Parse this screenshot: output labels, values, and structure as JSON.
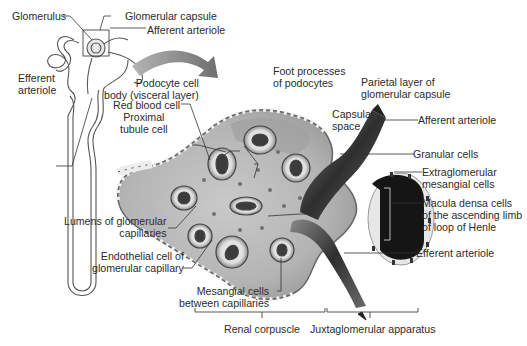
{
  "diagram": {
    "style": "grayscale anatomical illustration",
    "colors": {
      "background": "#ffffff",
      "text": "#2b2b2b",
      "leader_lines": "#333333",
      "tissue_light": "#d9d9d9",
      "tissue_mid": "#a8a8a8",
      "tissue_dark": "#3a3a3a",
      "arrow": "#8a8a8a"
    },
    "inset": {
      "name": "Nephron overview",
      "labels": {
        "glomerulus": "Glomerulus",
        "glomerular_capsule": "Glomerular capsule",
        "afferent_arteriole": "Afferent arteriole",
        "efferent_arteriole_1": "Efferent",
        "efferent_arteriole_2": "arteriole"
      }
    },
    "labels": {
      "podocyte_1": "Podocyte cell",
      "podocyte_2": "body (visceral layer)",
      "foot_processes_1": "Foot processes",
      "foot_processes_2": "of podocytes",
      "parietal_1": "Parietal layer of",
      "parietal_2": "glomerular capsule",
      "capsular_space_1": "Capsular",
      "capsular_space_2": "space",
      "afferent_arteriole": "Afferent arteriole",
      "red_blood_cell": "Red blood cell",
      "proximal_1": "Proximal",
      "proximal_2": "tubule cell",
      "granular_cells": "Granular cells",
      "extraglomerular_1": "Extraglomerular",
      "extraglomerular_2": "mesangial cells",
      "macula_densa_1": "Macula densa cells",
      "macula_densa_2": "of the ascending limb",
      "macula_densa_3": "of loop of Henle",
      "lumens_1": "Lumens of glomerular",
      "lumens_2": "capillaries",
      "endothelial_1": "Endothelial cell of",
      "endothelial_2": "glomerular capillary",
      "efferent_arteriole": "Efferent arteriole",
      "mesangial_1": "Mesangial cells",
      "mesangial_2": "between capillaries"
    },
    "brackets": {
      "renal_corpuscle": "Renal corpuscle",
      "juxtaglomerular_apparatus": "Juxtaglomerular apparatus"
    }
  }
}
